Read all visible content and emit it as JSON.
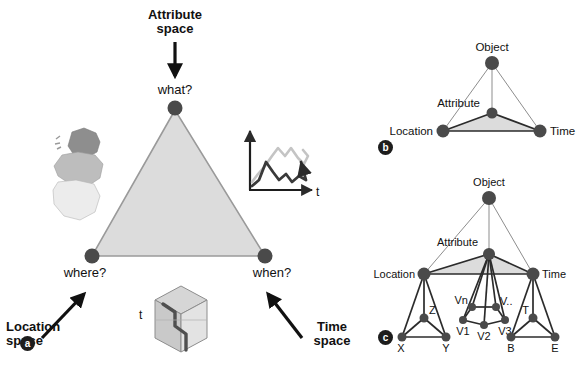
{
  "figure": {
    "colors": {
      "node_fill": "#4a4a4a",
      "triangle_fill": "#dcdcdc",
      "triangle_stroke": "#9a9a9a",
      "edge_dark": "#2b2b2b",
      "edge_light": "#8d8d8d",
      "text": "#111111",
      "map_dark": "#8e8e8e",
      "map_mid": "#bdbdbd",
      "map_light": "#ececec",
      "series_light": "#c4c4c4",
      "series_dark": "#3a3a3a",
      "cube_face_left": "#c9c9c9",
      "cube_face_right": "#e3e3e3",
      "cube_face_top": "#d6d6d6",
      "cube_trajectory": "#4f4f4f",
      "panel_tag_bg": "#1d1d1d"
    }
  },
  "panel_a": {
    "tag": "a",
    "callouts": {
      "attribute_space": "Attribute\nspace",
      "location_space": "Location\nspace",
      "time_space": "Time\nspace"
    },
    "vertices": {
      "top": "what?",
      "left": "where?",
      "right": "when?"
    },
    "cube_axis_label": "t",
    "timeseries_axis_label": "t",
    "timeseries": {
      "type": "line",
      "series": [
        {
          "name": "light-series",
          "color": "#c4c4c4",
          "points": "0,38 6,30 13,22 20,12 26,4 33,12 39,4 46,14 52,20 58,12 65,22"
        },
        {
          "name": "dark-series",
          "color": "#3a3a3a",
          "points": "0,42 7,36 14,18 21,28 27,36 34,30 40,38 47,32 54,36 61,18"
        }
      ]
    }
  },
  "panel_b": {
    "tag": "b",
    "nodes": [
      {
        "id": "object",
        "label": "Object",
        "x": 492,
        "y": 63,
        "r": 7.0,
        "label_dx": 0,
        "label_dy": -12,
        "anchor": "middle"
      },
      {
        "id": "attribute",
        "label": "Attribute",
        "x": 492,
        "y": 113,
        "r": 5.5,
        "label_dx": -12,
        "label_dy": -6,
        "anchor": "end"
      },
      {
        "id": "location",
        "label": "Location",
        "x": 443,
        "y": 131,
        "r": 6.5,
        "label_dx": -10,
        "label_dy": 4,
        "anchor": "end"
      },
      {
        "id": "time",
        "label": "Time",
        "x": 540,
        "y": 131,
        "r": 6.5,
        "label_dx": 10,
        "label_dy": 4,
        "anchor": "start"
      }
    ],
    "edges": [
      {
        "from": "object",
        "to": "location",
        "style": "light"
      },
      {
        "from": "object",
        "to": "time",
        "style": "light"
      },
      {
        "from": "object",
        "to": "attribute",
        "style": "light"
      },
      {
        "from": "attribute",
        "to": "location",
        "style": "dark"
      },
      {
        "from": "attribute",
        "to": "time",
        "style": "dark"
      },
      {
        "from": "location",
        "to": "time",
        "style": "dark"
      }
    ]
  },
  "panel_c": {
    "tag": "c",
    "nodes": [
      {
        "id": "object",
        "label": "Object",
        "x": 489,
        "y": 198,
        "r": 7.0,
        "anchor": "middle",
        "label_dx": 0,
        "label_dy": -12
      },
      {
        "id": "attribute",
        "label": "Attribute",
        "x": 489,
        "y": 254,
        "r": 6.0,
        "anchor": "end",
        "label_dx": -11,
        "label_dy": -8
      },
      {
        "id": "location",
        "label": "Location",
        "x": 424,
        "y": 274,
        "r": 6.5,
        "anchor": "end",
        "label_dx": -9,
        "label_dy": 4
      },
      {
        "id": "time",
        "label": "Time",
        "x": 533,
        "y": 274,
        "r": 6.5,
        "anchor": "start",
        "label_dx": 9,
        "label_dy": 4
      },
      {
        "id": "z",
        "label": "Z",
        "x": 424,
        "y": 318,
        "r": 4.5,
        "anchor": "start",
        "label_dx": 5,
        "label_dy": -4
      },
      {
        "id": "x",
        "label": "X",
        "x": 402,
        "y": 337,
        "r": 4.5,
        "anchor": "middle",
        "label_dx": -1,
        "label_dy": 15
      },
      {
        "id": "y",
        "label": "Y",
        "x": 446,
        "y": 337,
        "r": 4.5,
        "anchor": "middle",
        "label_dx": 0,
        "label_dy": 15
      },
      {
        "id": "vn",
        "label": "Vn",
        "x": 472,
        "y": 307,
        "r": 4.0,
        "anchor": "end",
        "label_dx": -4,
        "label_dy": -3
      },
      {
        "id": "vx",
        "label": "V..",
        "x": 496,
        "y": 307,
        "r": 4.0,
        "anchor": "start",
        "label_dx": 4,
        "label_dy": -2
      },
      {
        "id": "v1",
        "label": "V1",
        "x": 463,
        "y": 320,
        "r": 4.0,
        "anchor": "middle",
        "label_dx": 0,
        "label_dy": 15
      },
      {
        "id": "v2",
        "label": "V2",
        "x": 484,
        "y": 325,
        "r": 4.0,
        "anchor": "middle",
        "label_dx": 0,
        "label_dy": 15
      },
      {
        "id": "v3",
        "label": "V3",
        "x": 505,
        "y": 320,
        "r": 4.0,
        "anchor": "middle",
        "label_dx": 0,
        "label_dy": 15
      },
      {
        "id": "t",
        "label": "T",
        "x": 533,
        "y": 318,
        "r": 4.5,
        "anchor": "end",
        "label_dx": -4,
        "label_dy": -4
      },
      {
        "id": "b",
        "label": "B",
        "x": 511,
        "y": 337,
        "r": 4.5,
        "anchor": "middle",
        "label_dx": 0,
        "label_dy": 15
      },
      {
        "id": "e",
        "label": "E",
        "x": 555,
        "y": 337,
        "r": 4.5,
        "anchor": "middle",
        "label_dx": 0,
        "label_dy": 15
      }
    ],
    "edges": [
      {
        "from": "object",
        "to": "location",
        "style": "light"
      },
      {
        "from": "object",
        "to": "time",
        "style": "light"
      },
      {
        "from": "object",
        "to": "attribute",
        "style": "light"
      },
      {
        "from": "attribute",
        "to": "location",
        "style": "dark"
      },
      {
        "from": "attribute",
        "to": "time",
        "style": "dark"
      },
      {
        "from": "location",
        "to": "time",
        "style": "dark"
      },
      {
        "from": "location",
        "to": "z",
        "style": "dark"
      },
      {
        "from": "location",
        "to": "x",
        "style": "dark"
      },
      {
        "from": "location",
        "to": "y",
        "style": "dark"
      },
      {
        "from": "z",
        "to": "x",
        "style": "dark"
      },
      {
        "from": "z",
        "to": "y",
        "style": "dark"
      },
      {
        "from": "x",
        "to": "y",
        "style": "dark"
      },
      {
        "from": "attribute",
        "to": "vn",
        "style": "dark"
      },
      {
        "from": "attribute",
        "to": "vx",
        "style": "dark"
      },
      {
        "from": "attribute",
        "to": "v1",
        "style": "dark"
      },
      {
        "from": "attribute",
        "to": "v2",
        "style": "dark"
      },
      {
        "from": "attribute",
        "to": "v3",
        "style": "dark"
      },
      {
        "from": "vn",
        "to": "vx",
        "style": "dark"
      },
      {
        "from": "vn",
        "to": "v1",
        "style": "dark"
      },
      {
        "from": "vx",
        "to": "v3",
        "style": "dark"
      },
      {
        "from": "v1",
        "to": "v2",
        "style": "dark"
      },
      {
        "from": "v2",
        "to": "v3",
        "style": "dark"
      },
      {
        "from": "time",
        "to": "t",
        "style": "dark"
      },
      {
        "from": "time",
        "to": "b",
        "style": "dark"
      },
      {
        "from": "time",
        "to": "e",
        "style": "dark"
      },
      {
        "from": "t",
        "to": "b",
        "style": "dark"
      },
      {
        "from": "t",
        "to": "e",
        "style": "dark"
      },
      {
        "from": "b",
        "to": "e",
        "style": "dark"
      }
    ]
  }
}
